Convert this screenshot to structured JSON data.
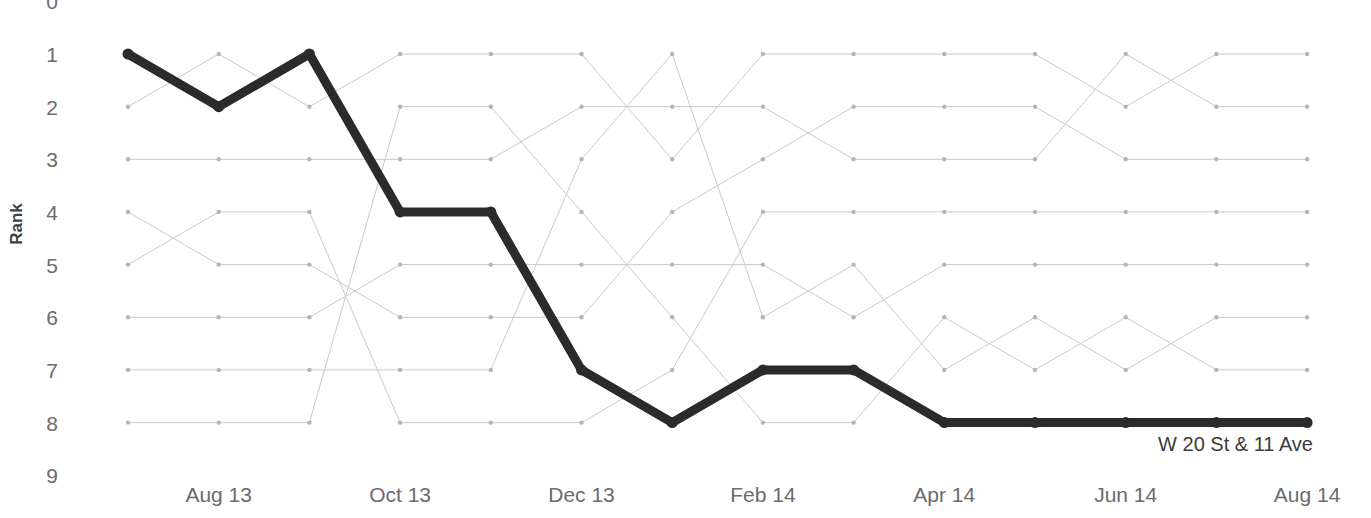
{
  "chart_data": {
    "type": "line",
    "subtype": "bump-chart",
    "title": "",
    "xlabel": "",
    "ylabel": "Rank",
    "ylim": [
      0,
      9
    ],
    "y_inverted": true,
    "grid": false,
    "legend_position": "inline-end-label",
    "y_tick_labels": [
      "0",
      "1",
      "2",
      "3",
      "4",
      "5",
      "6",
      "7",
      "8",
      "9"
    ],
    "y_tick_values": [
      0,
      1,
      2,
      3,
      4,
      5,
      6,
      7,
      8,
      9
    ],
    "x_tick_labels": [
      "Aug 13",
      "Oct 13",
      "Dec 13",
      "Feb 14",
      "Apr 14",
      "Jun 14",
      "Aug 14"
    ],
    "x_tick_indices": [
      1,
      3,
      5,
      7,
      9,
      11,
      13
    ],
    "x": [
      "Jul 13",
      "Aug 13",
      "Sep 13",
      "Oct 13",
      "Nov 13",
      "Dec 13",
      "Jan 14",
      "Feb 14",
      "Mar 14",
      "Apr 14",
      "May 14",
      "Jun 14",
      "Jul 14",
      "Aug 14"
    ],
    "n_periods": 14,
    "n_series": 8,
    "highlight_color": "#2b2b2b",
    "background_color": "#c9c9c9",
    "annotations": [
      {
        "text": "W 20 St & 11 Ave",
        "x_index": 13,
        "rank": 8
      }
    ],
    "series": [
      {
        "name": "W 20 St & 11 Ave",
        "highlighted": true,
        "values": [
          1,
          2,
          1,
          4,
          4,
          7,
          8,
          7,
          7,
          8,
          8,
          8,
          8,
          8
        ]
      },
      {
        "name": "series-b",
        "highlighted": false,
        "values": [
          2,
          1,
          2,
          1,
          1,
          1,
          3,
          1,
          1,
          1,
          1,
          2,
          1,
          1
        ]
      },
      {
        "name": "series-c",
        "highlighted": false,
        "values": [
          3,
          3,
          3,
          3,
          3,
          2,
          2,
          2,
          3,
          3,
          3,
          1,
          2,
          2
        ]
      },
      {
        "name": "series-d",
        "highlighted": false,
        "values": [
          4,
          5,
          5,
          6,
          6,
          6,
          4,
          3,
          2,
          2,
          2,
          3,
          3,
          3
        ]
      },
      {
        "name": "series-e",
        "highlighted": false,
        "values": [
          5,
          4,
          4,
          8,
          8,
          8,
          7,
          4,
          4,
          4,
          4,
          4,
          4,
          4
        ]
      },
      {
        "name": "series-f",
        "highlighted": false,
        "values": [
          6,
          6,
          6,
          5,
          5,
          5,
          5,
          5,
          6,
          5,
          5,
          5,
          5,
          5
        ]
      },
      {
        "name": "series-g",
        "highlighted": false,
        "values": [
          7,
          7,
          7,
          7,
          7,
          3,
          1,
          6,
          5,
          7,
          6,
          7,
          6,
          6
        ]
      },
      {
        "name": "series-h",
        "highlighted": false,
        "values": [
          8,
          8,
          8,
          2,
          2,
          4,
          6,
          8,
          8,
          6,
          7,
          6,
          7,
          7
        ]
      }
    ]
  },
  "axis": {
    "y_title": "Rank"
  }
}
